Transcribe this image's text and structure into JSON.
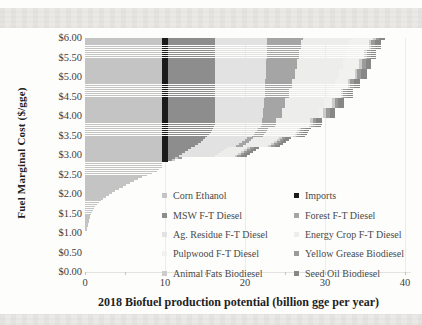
{
  "chart_data": {
    "type": "area",
    "subtype": "supply-curve-of-stacked-price-rows",
    "xlabel": "2018 Biofuel production potential (billion gge per year)",
    "ylabel": "Fuel Marginal Cost ($/gge)",
    "xlim": [
      0,
      40
    ],
    "ylim": [
      0,
      6
    ],
    "grid": "vertical-only",
    "legend_position": "inside-lower-right",
    "x_ticks": [
      {
        "v": 0,
        "label": "0"
      },
      {
        "v": 10,
        "label": "10"
      },
      {
        "v": 20,
        "label": "20"
      },
      {
        "v": 30,
        "label": "30"
      },
      {
        "v": 40,
        "label": "40"
      }
    ],
    "x_minor_ticks": [
      0,
      5,
      10,
      15,
      20,
      25,
      30,
      35,
      40
    ],
    "x_gridlines": [
      10,
      20,
      30,
      40
    ],
    "y_ticks": [
      {
        "v": 0.0,
        "label": "$0.00"
      },
      {
        "v": 0.5,
        "label": "$0.50"
      },
      {
        "v": 1.0,
        "label": "$1.00"
      },
      {
        "v": 1.5,
        "label": "$1.50"
      },
      {
        "v": 2.0,
        "label": "$2.00"
      },
      {
        "v": 2.5,
        "label": "$2.50"
      },
      {
        "v": 3.0,
        "label": "$3.00"
      },
      {
        "v": 3.5,
        "label": "$3.50"
      },
      {
        "v": 4.0,
        "label": "$4.00"
      },
      {
        "v": 4.5,
        "label": "$4.50"
      },
      {
        "v": 5.0,
        "label": "$5.00"
      },
      {
        "v": 5.5,
        "label": "$5.50"
      },
      {
        "v": 6.0,
        "label": "$6.00"
      }
    ],
    "price_min": 1.1,
    "price_max": 6.0,
    "price_step": 0.05,
    "fuels": [
      {
        "key": "corn",
        "label": "Corn Ethanol",
        "color": "#c4c4c4",
        "supply": [
          [
            1.05,
            0
          ],
          [
            1.1,
            0.25
          ],
          [
            1.3,
            0.45
          ],
          [
            1.5,
            0.75
          ],
          [
            1.7,
            1.3
          ],
          [
            1.9,
            2.2
          ],
          [
            2.0,
            3.0
          ],
          [
            2.1,
            3.8
          ],
          [
            2.2,
            4.7
          ],
          [
            2.3,
            5.6
          ],
          [
            2.4,
            6.6
          ],
          [
            2.5,
            7.7
          ],
          [
            2.6,
            9.0
          ],
          [
            2.7,
            9.6
          ],
          [
            6.0,
            9.6
          ]
        ]
      },
      {
        "key": "imports",
        "label": "Imports",
        "color": "#1b1b1b",
        "supply": [
          [
            2.8,
            0
          ],
          [
            2.85,
            0.8
          ],
          [
            6.0,
            0.8
          ]
        ]
      },
      {
        "key": "msw",
        "label": "MSW F-T Diesel",
        "color": "#8d8d8d",
        "supply": [
          [
            2.85,
            0
          ],
          [
            2.9,
            0.5
          ],
          [
            3.0,
            1.3
          ],
          [
            3.1,
            2.1
          ],
          [
            3.2,
            2.9
          ],
          [
            3.3,
            3.7
          ],
          [
            3.4,
            4.4
          ],
          [
            3.5,
            4.9
          ],
          [
            3.6,
            5.3
          ],
          [
            3.8,
            5.9
          ],
          [
            6.0,
            5.9
          ]
        ]
      },
      {
        "key": "agres",
        "label": "Ag. Residue F-T Diesel",
        "color": "#e2e2e2",
        "quantize": 0.25,
        "supply": [
          [
            2.85,
            0
          ],
          [
            2.9,
            3.5
          ],
          [
            3.0,
            4.5
          ],
          [
            3.25,
            5.2
          ],
          [
            3.5,
            5.6
          ],
          [
            4.0,
            6.0
          ],
          [
            5.0,
            6.3
          ],
          [
            6.0,
            6.5
          ]
        ]
      },
      {
        "key": "forest",
        "label": "Forest F-T Diesel",
        "color": "#a5a5a5",
        "quantize": 0.25,
        "supply": [
          [
            3.0,
            0
          ],
          [
            3.1,
            0.4
          ],
          [
            3.25,
            0.8
          ],
          [
            3.5,
            1.3
          ],
          [
            3.75,
            1.8
          ],
          [
            4.0,
            2.3
          ],
          [
            4.5,
            3.0
          ],
          [
            5.0,
            3.6
          ],
          [
            5.5,
            4.0
          ],
          [
            6.0,
            4.4
          ]
        ]
      },
      {
        "key": "energy",
        "label": "Energy Crop F-T Diesel",
        "color": "#ededeb",
        "quantize": 0.25,
        "supply": [
          [
            2.9,
            0
          ],
          [
            3.0,
            2.5
          ],
          [
            3.25,
            3.2
          ],
          [
            3.5,
            3.8
          ],
          [
            4.0,
            4.6
          ],
          [
            4.5,
            5.2
          ],
          [
            5.0,
            5.6
          ],
          [
            5.5,
            5.9
          ],
          [
            6.0,
            6.2
          ]
        ]
      },
      {
        "key": "pulp",
        "label": "Pulpwood F-T Diesel",
        "color": "#f1f1ef",
        "quantize": 0.25,
        "supply": [
          [
            3.9,
            0
          ],
          [
            4.0,
            0.6
          ],
          [
            4.5,
            1.3
          ],
          [
            5.0,
            1.9
          ],
          [
            5.5,
            2.3
          ],
          [
            6.0,
            2.6
          ]
        ]
      },
      {
        "key": "animal",
        "label": "Animal Fats Biodiesel",
        "color": "#cccccc",
        "supply": [
          [
            2.85,
            0
          ],
          [
            2.9,
            0.35
          ],
          [
            6.0,
            0.35
          ]
        ]
      },
      {
        "key": "yellow",
        "label": "Yellow Grease Biodiesel",
        "color": "#9b9b9b",
        "supply": [
          [
            2.9,
            0
          ],
          [
            2.95,
            0.45
          ],
          [
            6.0,
            0.45
          ]
        ]
      },
      {
        "key": "seed",
        "label": "Seed Oil Biodiesel",
        "color": "#878787",
        "supply": [
          [
            2.95,
            0
          ],
          [
            3.0,
            0.7
          ],
          [
            6.0,
            0.7
          ]
        ]
      }
    ],
    "legend_columns": [
      [
        "corn",
        "msw",
        "agres",
        "pulp",
        "animal"
      ],
      [
        "imports",
        "forest",
        "energy",
        "yellow",
        "seed"
      ]
    ]
  }
}
